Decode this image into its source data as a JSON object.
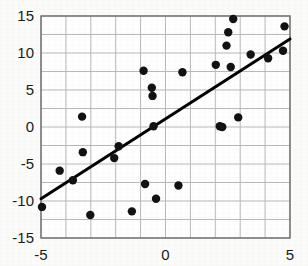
{
  "chart_data": {
    "type": "scatter",
    "title": "",
    "subtitle": "",
    "xlabel": "",
    "ylabel": "",
    "xlim": [
      -5,
      5
    ],
    "ylim": [
      -15,
      15
    ],
    "xticks": [
      -5,
      0,
      5
    ],
    "xtick_labels": [
      "-5",
      "0",
      "5"
    ],
    "yticks": [
      -15,
      -10,
      -5,
      0,
      5,
      10,
      15
    ],
    "ytick_labels": [
      "-15",
      "-10",
      "-5",
      "0",
      "5",
      "10",
      "15"
    ],
    "grid": true,
    "grid_x_step": 1,
    "grid_y_step": 2.5,
    "grid_color": "#b9b9b9",
    "frame_color": "#6e6e6e",
    "legend": null,
    "legend_position": "none",
    "marker_color": "#111111",
    "marker_size": 4.2,
    "series": [
      {
        "name": "observations",
        "type": "scatter",
        "points": [
          [
            -4.96,
            -10.8
          ],
          [
            -4.25,
            -5.9
          ],
          [
            -3.72,
            -7.2
          ],
          [
            -3.35,
            1.4
          ],
          [
            -3.32,
            -3.4
          ],
          [
            -3.02,
            -11.9
          ],
          [
            -2.06,
            -4.2
          ],
          [
            -1.88,
            -2.6
          ],
          [
            -1.35,
            -11.4
          ],
          [
            -0.88,
            7.6
          ],
          [
            -0.82,
            -7.7
          ],
          [
            -0.55,
            5.3
          ],
          [
            -0.52,
            4.2
          ],
          [
            -0.48,
            0.1
          ],
          [
            -0.38,
            -9.7
          ],
          [
            0.52,
            -7.9
          ],
          [
            0.68,
            7.4
          ],
          [
            2.02,
            8.4
          ],
          [
            2.18,
            0.1
          ],
          [
            2.28,
            0.0
          ],
          [
            2.45,
            11.0
          ],
          [
            2.52,
            12.8
          ],
          [
            2.62,
            8.1
          ],
          [
            2.72,
            14.6
          ],
          [
            2.92,
            1.3
          ],
          [
            3.42,
            9.8
          ],
          [
            4.12,
            9.3
          ],
          [
            4.72,
            10.3
          ],
          [
            4.78,
            13.6
          ]
        ]
      }
    ],
    "trendline": {
      "name": "regression-line",
      "type": "line",
      "color": "#000000",
      "width": 3,
      "x_start": -5,
      "y_start": -9.7,
      "x_end": 5,
      "y_end": 11.9,
      "slope": 2.16,
      "intercept": 1.1
    }
  },
  "axes": {
    "x_axis_name": "x-axis",
    "y_axis_name": "y-axis"
  }
}
